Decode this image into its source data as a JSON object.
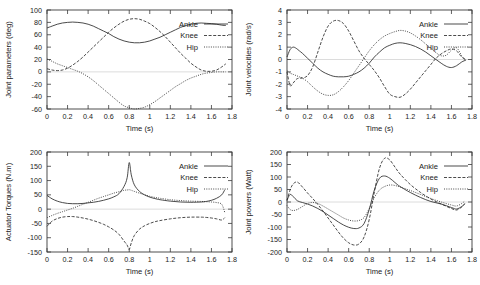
{
  "figure": {
    "layout": "2x2",
    "series_names": [
      "Ankle",
      "Knee",
      "Hip"
    ],
    "series_styles": [
      "solid",
      "dashed",
      "dotted"
    ],
    "line_color": "#2b2b2b",
    "axis_color": "#3b3b3b",
    "background": "#ffffff"
  },
  "legend": {
    "ankle": "Ankle",
    "knee": "Knee",
    "hip": "Hip"
  },
  "chart_data": [
    {
      "type": "line",
      "id": "joint-parameters",
      "title": "",
      "xlabel": "Time (s)",
      "ylabel": "Joint parameters (deg)",
      "xlim": [
        0,
        1.8
      ],
      "ylim": [
        -60,
        100
      ],
      "xticks": [
        0,
        0.2,
        0.4,
        0.6,
        0.8,
        1,
        1.2,
        1.4,
        1.6,
        1.8
      ],
      "xticklabels": [
        "0",
        "0.2",
        "0.4",
        "0.6",
        "0.8",
        "1",
        "1.2",
        "1.4",
        "1.6",
        "1.8"
      ],
      "yticks": [
        -60,
        -40,
        -20,
        0,
        20,
        40,
        60,
        80,
        100
      ],
      "yticklabels": [
        "-60",
        "-40",
        "-20",
        "0",
        "20",
        "40",
        "60",
        "80",
        "100"
      ],
      "grid": false,
      "legend_position": "right",
      "x": [
        0,
        0.05,
        0.1,
        0.15,
        0.2,
        0.25,
        0.3,
        0.35,
        0.4,
        0.45,
        0.5,
        0.55,
        0.6,
        0.65,
        0.7,
        0.75,
        0.8,
        0.85,
        0.9,
        0.95,
        1,
        1.05,
        1.1,
        1.15,
        1.2,
        1.25,
        1.3,
        1.35,
        1.4,
        1.45,
        1.5,
        1.55,
        1.6,
        1.65,
        1.7,
        1.74
      ],
      "series": [
        {
          "name": "Ankle",
          "style": "solid",
          "values": [
            71,
            74,
            77,
            79,
            80,
            80.5,
            80,
            79,
            77,
            74,
            70,
            66,
            62,
            57,
            53,
            50,
            48,
            47,
            47,
            48,
            50,
            53,
            56,
            60,
            64,
            68,
            72,
            75,
            77,
            78.5,
            79,
            78.5,
            78,
            77,
            75.5,
            75
          ]
        },
        {
          "name": "Knee",
          "style": "dashed",
          "values": [
            5,
            3,
            2,
            3,
            6,
            11,
            17,
            24,
            32,
            40,
            48,
            56,
            64,
            71,
            77,
            82,
            85,
            86,
            85,
            82,
            78,
            72,
            65,
            57,
            48,
            39,
            30,
            22,
            14,
            8,
            3,
            1,
            1,
            3,
            8,
            13
          ]
        },
        {
          "name": "Hip",
          "style": "dotted",
          "values": [
            21,
            17,
            13,
            10,
            7,
            4,
            1,
            -3,
            -8,
            -14,
            -21,
            -28,
            -35,
            -42,
            -49,
            -55,
            -58,
            -60,
            -59,
            -57,
            -53,
            -48,
            -42,
            -36,
            -30,
            -24,
            -19,
            -14,
            -10,
            -7,
            -4,
            -2,
            -1,
            0,
            0,
            0
          ]
        }
      ]
    },
    {
      "type": "line",
      "id": "joint-velocities",
      "title": "",
      "xlabel": "Time (s)",
      "ylabel": "Joint velocities (rad/s)",
      "xlim": [
        0,
        1.8
      ],
      "ylim": [
        -4,
        4
      ],
      "xticks": [
        0,
        0.2,
        0.4,
        0.6,
        0.8,
        1,
        1.2,
        1.4,
        1.6,
        1.8
      ],
      "xticklabels": [
        "0",
        "0.2",
        "0.4",
        "0.6",
        "0.8",
        "1",
        "1.2",
        "1.4",
        "1.6",
        "1.8"
      ],
      "yticks": [
        -4,
        -3,
        -2,
        -1,
        0,
        1,
        2,
        3,
        4
      ],
      "yticklabels": [
        "-4",
        "-3",
        "-2",
        "-1",
        "0",
        "1",
        "2",
        "3",
        "4"
      ],
      "grid": false,
      "legend_position": "right",
      "x": [
        0,
        0.03,
        0.06,
        0.09,
        0.12,
        0.15,
        0.2,
        0.25,
        0.3,
        0.35,
        0.4,
        0.45,
        0.5,
        0.55,
        0.6,
        0.65,
        0.7,
        0.75,
        0.8,
        0.85,
        0.9,
        0.95,
        1,
        1.05,
        1.1,
        1.15,
        1.2,
        1.25,
        1.3,
        1.35,
        1.4,
        1.45,
        1.5,
        1.55,
        1.6,
        1.65,
        1.7,
        1.74
      ],
      "series": [
        {
          "name": "Ankle",
          "style": "solid",
          "values": [
            0.2,
            0.8,
            1.0,
            0.9,
            0.7,
            0.5,
            0.1,
            -0.3,
            -0.7,
            -1.0,
            -1.2,
            -1.35,
            -1.4,
            -1.4,
            -1.35,
            -1.2,
            -1.0,
            -0.7,
            -0.3,
            0.2,
            0.6,
            0.95,
            1.15,
            1.3,
            1.35,
            1.3,
            1.2,
            1.05,
            0.85,
            0.6,
            0.3,
            0.0,
            -0.3,
            -0.55,
            -0.65,
            -0.5,
            -0.2,
            -0.05
          ]
        },
        {
          "name": "Knee",
          "style": "dashed",
          "values": [
            -1.0,
            -2.1,
            -1.9,
            -1.6,
            -1.5,
            -1.5,
            -1.3,
            -0.6,
            0.6,
            1.8,
            2.7,
            3.1,
            3.15,
            2.9,
            2.3,
            1.5,
            0.7,
            0.1,
            -0.4,
            -0.9,
            -1.5,
            -2.2,
            -2.8,
            -3.0,
            -3.05,
            -2.8,
            -2.4,
            -1.9,
            -1.4,
            -0.9,
            -0.4,
            0.1,
            0.45,
            0.7,
            0.85,
            0.7,
            0.2,
            0.0
          ]
        },
        {
          "name": "Hip",
          "style": "dotted",
          "values": [
            -0.9,
            -1.1,
            -1.2,
            -1.3,
            -1.4,
            -1.5,
            -1.8,
            -2.2,
            -2.55,
            -2.8,
            -2.9,
            -2.85,
            -2.6,
            -2.2,
            -1.7,
            -1.1,
            -0.5,
            0.1,
            0.7,
            1.2,
            1.6,
            1.9,
            2.1,
            2.25,
            2.35,
            2.3,
            2.15,
            1.9,
            1.6,
            1.25,
            0.9,
            0.55,
            0.3,
            0.35,
            0.75,
            0.95,
            0.3,
            -0.1
          ]
        }
      ]
    },
    {
      "type": "line",
      "id": "actuator-torques",
      "title": "",
      "xlabel": "Time (s)",
      "ylabel": "Actuator Torques (N.m)",
      "xlim": [
        0,
        1.8
      ],
      "ylim": [
        -150,
        200
      ],
      "xticks": [
        0,
        0.2,
        0.4,
        0.6,
        0.8,
        1,
        1.2,
        1.4,
        1.6,
        1.8
      ],
      "xticklabels": [
        "0",
        "0.2",
        "0.4",
        "0.6",
        "0.8",
        "1",
        "1.2",
        "1.4",
        "1.6",
        "1.8"
      ],
      "yticks": [
        -150,
        -100,
        -50,
        0,
        50,
        100,
        150,
        200
      ],
      "yticklabels": [
        "-150",
        "-100",
        "-50",
        "0",
        "50",
        "100",
        "150",
        "200"
      ],
      "grid": false,
      "legend_position": "right",
      "x": [
        0,
        0.05,
        0.1,
        0.15,
        0.2,
        0.25,
        0.3,
        0.35,
        0.4,
        0.45,
        0.5,
        0.55,
        0.6,
        0.65,
        0.7,
        0.75,
        0.78,
        0.8,
        0.82,
        0.85,
        0.9,
        0.95,
        1,
        1.05,
        1.1,
        1.2,
        1.3,
        1.4,
        1.5,
        1.55,
        1.6,
        1.65,
        1.7,
        1.73
      ],
      "series": [
        {
          "name": "Ankle",
          "style": "solid",
          "values": [
            48,
            36,
            28,
            23,
            20,
            19,
            19,
            20,
            22,
            24,
            27,
            31,
            36,
            43,
            54,
            80,
            110,
            163,
            120,
            85,
            62,
            50,
            42,
            37,
            33,
            28,
            25,
            24,
            25,
            27,
            31,
            38,
            50,
            68
          ]
        },
        {
          "name": "Knee",
          "style": "dashed",
          "values": [
            -60,
            -42,
            -33,
            -28,
            -26,
            -26,
            -28,
            -31,
            -35,
            -40,
            -46,
            -53,
            -62,
            -73,
            -88,
            -112,
            -126,
            -141,
            -118,
            -92,
            -70,
            -58,
            -50,
            -44,
            -40,
            -34,
            -30,
            -28,
            -28,
            -29,
            -31,
            -34,
            -38,
            -30
          ]
        },
        {
          "name": "Hip",
          "style": "dotted",
          "values": [
            -30,
            -22,
            -15,
            -9,
            -3,
            3,
            10,
            17,
            24,
            31,
            38,
            44,
            50,
            56,
            61,
            66,
            67,
            68,
            66,
            62,
            56,
            50,
            45,
            41,
            38,
            33,
            30,
            28,
            27,
            26,
            25,
            23,
            17,
            -12
          ]
        }
      ]
    },
    {
      "type": "line",
      "id": "joint-powers",
      "title": "",
      "xlabel": "Time (s)",
      "ylabel": "Joint powers (Watt)",
      "xlim": [
        0,
        1.8
      ],
      "ylim": [
        -200,
        200
      ],
      "xticks": [
        0,
        0.2,
        0.4,
        0.6,
        0.8,
        1,
        1.2,
        1.4,
        1.6,
        1.8
      ],
      "xticklabels": [
        "0",
        "0.2",
        "0.4",
        "0.6",
        "0.8",
        "1",
        "1.2",
        "1.4",
        "1.6",
        "1.8"
      ],
      "yticks": [
        -200,
        -150,
        -100,
        -50,
        0,
        50,
        100,
        150,
        200
      ],
      "yticklabels": [
        "-200",
        "-150",
        "-100",
        "-50",
        "0",
        "50",
        "100",
        "150",
        "200"
      ],
      "grid": false,
      "legend_position": "right",
      "x": [
        0,
        0.03,
        0.06,
        0.1,
        0.15,
        0.2,
        0.25,
        0.3,
        0.35,
        0.4,
        0.45,
        0.5,
        0.55,
        0.6,
        0.65,
        0.7,
        0.75,
        0.8,
        0.85,
        0.9,
        0.95,
        1,
        1.05,
        1.1,
        1.2,
        1.3,
        1.4,
        1.5,
        1.6,
        1.65,
        1.7,
        1.73
      ],
      "series": [
        {
          "name": "Ankle",
          "style": "solid",
          "values": [
            8,
            30,
            22,
            5,
            -2,
            -8,
            -16,
            -26,
            -38,
            -52,
            -66,
            -80,
            -92,
            -101,
            -106,
            -104,
            -86,
            -30,
            48,
            95,
            104,
            95,
            78,
            62,
            38,
            18,
            2,
            -8,
            -22,
            -28,
            -18,
            -8
          ]
        },
        {
          "name": "Knee",
          "style": "dashed",
          "values": [
            5,
            48,
            72,
            80,
            60,
            36,
            14,
            -10,
            -36,
            -64,
            -92,
            -120,
            -145,
            -163,
            -172,
            -168,
            -140,
            -70,
            40,
            135,
            175,
            168,
            140,
            112,
            70,
            38,
            12,
            -8,
            -26,
            -32,
            -20,
            -6
          ]
        },
        {
          "name": "Hip",
          "style": "dotted",
          "values": [
            -14,
            -30,
            -34,
            -30,
            -18,
            -6,
            -2,
            -6,
            -16,
            -28,
            -40,
            -52,
            -64,
            -72,
            -76,
            -74,
            -62,
            -26,
            18,
            48,
            62,
            68,
            66,
            60,
            46,
            30,
            14,
            0,
            -12,
            -16,
            -6,
            4
          ]
        }
      ]
    }
  ]
}
